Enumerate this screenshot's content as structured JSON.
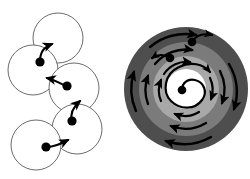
{
  "figure": {
    "title": "Two-panel motion diagram",
    "background_color": "#ffffff",
    "width": 250,
    "height": 179,
    "panels": [
      {
        "id": "left-panel",
        "name": "hopping-chain-panel",
        "description": "Chain of five outlined circles with center dots and curved arrows",
        "circle_stroke_color": "#5a5a5a",
        "circle_fill_color": "#ffffff",
        "dot_color": "#000000",
        "arrow_color": "#000000",
        "circles": [
          {
            "label": "circle-1",
            "cx": 58,
            "cy": 38,
            "r": 25,
            "dot_cx": 58,
            "dot_cy": 38,
            "has_dot": false
          },
          {
            "label": "circle-2",
            "cx": 33,
            "cy": 70,
            "r": 25,
            "dot_cx": 40,
            "dot_cy": 62,
            "has_dot": true
          },
          {
            "label": "circle-3",
            "cx": 74,
            "cy": 88,
            "r": 25,
            "dot_cx": 67,
            "dot_cy": 86,
            "has_dot": true
          },
          {
            "label": "circle-4",
            "cx": 77,
            "cy": 129,
            "r": 25,
            "dot_cx": 72,
            "dot_cy": 121,
            "has_dot": true
          },
          {
            "label": "circle-5",
            "cx": 36,
            "cy": 145,
            "r": 25,
            "dot_cx": 46,
            "dot_cy": 147,
            "has_dot": true
          }
        ],
        "arrows": [
          {
            "label": "arrow-2-to-1",
            "from": "circle-2",
            "to": "circle-1"
          },
          {
            "label": "arrow-3-to-2",
            "from": "circle-3",
            "to": "circle-2"
          },
          {
            "label": "arrow-4-to-3",
            "from": "circle-4",
            "to": "circle-3"
          },
          {
            "label": "arrow-5-to-4",
            "from": "circle-5",
            "to": "circle-4"
          }
        ]
      },
      {
        "id": "right-panel",
        "name": "concentric-rings-panel",
        "description": "Four concentric zones with circulating arrows and a central spiral",
        "center_x": 186,
        "center_y": 89,
        "rings": [
          {
            "label": "ring-outer",
            "radius": 68,
            "color": "#4e4e4e",
            "arrow_count": 4
          },
          {
            "label": "ring-middle",
            "radius": 52,
            "color": "#7b7b7b",
            "arrow_count": 4
          },
          {
            "label": "ring-inner",
            "radius": 37,
            "color": "#a8a8a8",
            "arrow_count": 4
          },
          {
            "label": "ring-core",
            "radius": 22,
            "color": "#ffffff",
            "arrow_count": 0
          }
        ],
        "dots": [
          {
            "label": "dot-outer",
            "cx": 192,
            "cy": 42
          },
          {
            "label": "dot-middle",
            "cx": 170,
            "cy": 58
          },
          {
            "label": "dot-core",
            "cx": 182,
            "cy": 90
          }
        ],
        "arrow_color": "#000000",
        "spiral": {
          "label": "center-spiral-arrow",
          "turns": 1.35
        }
      }
    ]
  }
}
